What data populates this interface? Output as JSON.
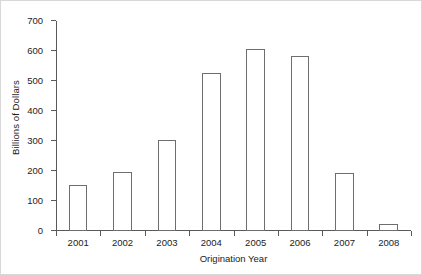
{
  "chart_data": {
    "type": "bar",
    "title": "",
    "subtitle": "",
    "xlabel": "Origination Year",
    "ylabel": "Billions of Dollars",
    "categories": [
      "2001",
      "2002",
      "2003",
      "2004",
      "2005",
      "2006",
      "2007",
      "2008"
    ],
    "values": [
      155,
      197,
      304,
      527,
      606,
      585,
      193,
      25
    ],
    "ylim": [
      0,
      700
    ],
    "yticks": [
      0,
      100,
      200,
      300,
      400,
      500,
      600,
      700
    ],
    "ytick_labels": [
      "0",
      "100",
      "200",
      "300",
      "400",
      "500",
      "600",
      "700"
    ],
    "grid": false,
    "legend": null,
    "legend_position": "none",
    "bar_style": {
      "fill": "#ffffff",
      "edge": "#6e6e6e",
      "edge_width": 1
    },
    "axis_color": "#5a5a5a",
    "background": "#ffffff",
    "annotations": []
  }
}
